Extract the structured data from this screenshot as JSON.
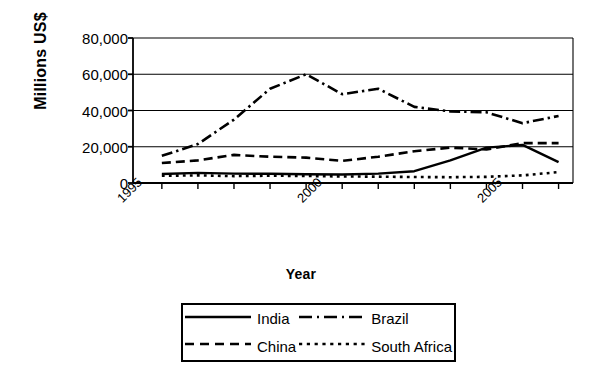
{
  "chart_data": {
    "type": "line",
    "title": "",
    "xlabel": "Year",
    "ylabel": "Millions US$",
    "xlim": [
      1995.2,
      2007.4
    ],
    "ylim": [
      0,
      80000
    ],
    "grid": true,
    "legend_position": "bottom",
    "yticks": [
      0,
      20000,
      40000,
      60000,
      80000
    ],
    "ytick_labels": [
      "0",
      "20,000",
      "40,000",
      "60,000",
      "80,000"
    ],
    "xtick_labels": [
      "1995",
      "2000",
      "2005"
    ],
    "xtick_values": [
      1995,
      2000,
      2005
    ],
    "x": [
      1996,
      1997,
      1998,
      1999,
      2000,
      2001,
      2002,
      2003,
      2004,
      2005,
      2006,
      2007
    ],
    "series": [
      {
        "name": "India",
        "style": "solid",
        "values": [
          5000,
          5600,
          5200,
          5100,
          4800,
          4700,
          5200,
          6500,
          12500,
          19500,
          21000,
          11500
        ]
      },
      {
        "name": "China",
        "style": "dashed",
        "values": [
          11000,
          12500,
          15500,
          14500,
          14000,
          12200,
          14500,
          17500,
          19500,
          18500,
          22000,
          22000
        ]
      },
      {
        "name": "Brazil",
        "style": "dash-dot",
        "values": [
          15000,
          21500,
          35000,
          52000,
          60000,
          49000,
          52000,
          42000,
          39500,
          39000,
          33000,
          37000
        ]
      },
      {
        "name": "South Africa",
        "style": "dotted",
        "values": [
          4000,
          4200,
          3800,
          4000,
          3900,
          3600,
          3500,
          3300,
          3200,
          3400,
          4200,
          6000
        ]
      }
    ]
  },
  "legend": {
    "entries": [
      {
        "label": "India",
        "key": "solid-line-key"
      },
      {
        "label": "Brazil",
        "key": "dash-dot-line-key"
      },
      {
        "label": "China",
        "key": "dashed-line-key"
      },
      {
        "label": "South Africa",
        "key": "dotted-line-key"
      }
    ]
  }
}
